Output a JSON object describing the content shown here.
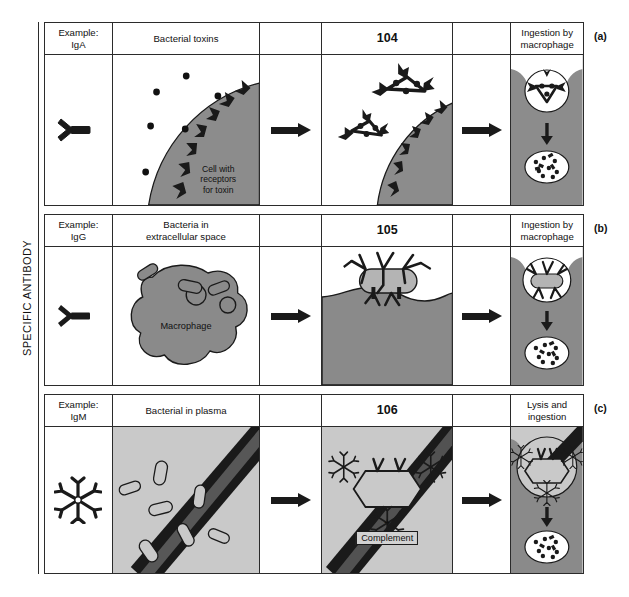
{
  "figure": {
    "axis_label": "SPECIFIC ANTIBODY",
    "row_tags": {
      "a": "(a)",
      "b": "(b)",
      "c": "(c)"
    }
  },
  "colors": {
    "ink": "#1a1a1a",
    "rule": "#2b2b2b",
    "cell_gray": "#8c8c8c",
    "macrophage_gray": "#8a8a8a",
    "plasma_gray": "#c9c9c9",
    "bacteria_gray": "#b4b4b4",
    "vesicle_white": "#ffffff"
  },
  "rows": [
    {
      "id": "a",
      "tag": "(a)",
      "headers": {
        "example": "Example:\nIgA",
        "example_line1": "Example:",
        "example_line2": "IgA",
        "stage1": "Bacterial toxins",
        "arrow1": "",
        "stage2": "104",
        "arrow2": "",
        "stage3_line1": "Ingestion by",
        "stage3_line2": "macrophage"
      },
      "antibody_icon": "igA-monomer-icon",
      "scene_labels": {
        "cell_receptor_line1": "Cell with",
        "cell_receptor_line2": "receptors",
        "cell_receptor_line3": "for toxin"
      }
    },
    {
      "id": "b",
      "tag": "(b)",
      "headers": {
        "example_line1": "Example:",
        "example_line2": "IgG",
        "stage1_line1": "Bacteria in",
        "stage1_line2": "extracellular space",
        "stage2": "105",
        "stage3_line1": "Ingestion by",
        "stage3_line2": "macrophage"
      },
      "antibody_icon": "igG-monomer-icon",
      "scene_labels": {
        "macrophage": "Macrophage"
      }
    },
    {
      "id": "c",
      "tag": "(c)",
      "headers": {
        "example_line1": "Example:",
        "example_line2": "IgM",
        "stage1": "Bacterial in plasma",
        "stage2": "106",
        "stage3": "Lysis and ingestion"
      },
      "antibody_icon": "igM-pentamer-icon",
      "scene_labels": {
        "plus": "+",
        "complement": "Complement"
      }
    }
  ]
}
